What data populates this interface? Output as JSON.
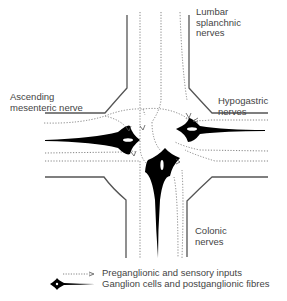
{
  "labels": {
    "lumbar": "Lumbar\nsplanchnic\nnerves",
    "ascending": "Ascending\nmesenteric nerve",
    "hypogastric": "Hypogastric\nnerves",
    "colonic": "Colonic\nnerves"
  },
  "legend": {
    "items": [
      {
        "symbol": "dotted-arrow",
        "label": "Preganglionic and sensory inputs"
      },
      {
        "symbol": "ganglion-cell",
        "label": "Ganglion cells and postganglionic fibres"
      }
    ]
  },
  "colors": {
    "outline": "#555555",
    "dotted": "#777777",
    "ganglion": "#000000"
  }
}
